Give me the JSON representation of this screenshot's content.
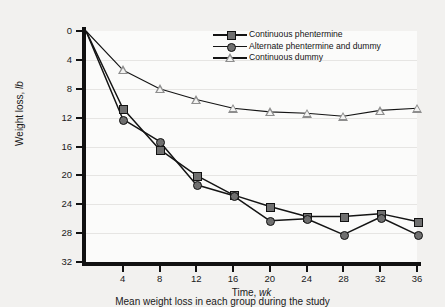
{
  "chart_data": {
    "type": "line",
    "title": "",
    "caption": "Mean weight loss in each group during the study",
    "xlabel_plain": "Time, ",
    "xlabel_italic": "wk",
    "ylabel_plain": "Weight loss, ",
    "ylabel_italic": "lb",
    "x": [
      0,
      4,
      8,
      12,
      16,
      20,
      24,
      28,
      32,
      36
    ],
    "xlim": [
      0,
      36
    ],
    "ylim": [
      0,
      32
    ],
    "y_inverted": true,
    "xticks": [
      4,
      8,
      12,
      16,
      20,
      24,
      28,
      32,
      36
    ],
    "yticks": [
      0,
      4,
      8,
      12,
      16,
      20,
      24,
      28,
      32
    ],
    "grid": "horizontal",
    "legend_position": "top-right",
    "series": [
      {
        "name": "Continuous phentermine",
        "marker": "filled-square",
        "color": "#6f6f6f",
        "values": [
          0,
          10.7,
          16.4,
          20.0,
          22.7,
          24.3,
          25.7,
          25.7,
          25.3,
          26.4
        ]
      },
      {
        "name": "Alternate phentermine and dummy",
        "marker": "filled-circle",
        "color": "#6f6f6f",
        "values": [
          0,
          12.2,
          15.3,
          21.3,
          22.8,
          26.3,
          26.0,
          28.2,
          25.8,
          28.2
        ]
      },
      {
        "name": "Continuous dummy",
        "marker": "open-triangle",
        "color": "#8e8e8e",
        "values": [
          0,
          5.4,
          8.0,
          9.5,
          10.7,
          11.2,
          11.4,
          11.8,
          11.0,
          10.7
        ]
      }
    ]
  }
}
